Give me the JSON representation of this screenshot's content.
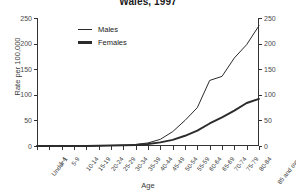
{
  "chart_data": {
    "type": "line",
    "title": "Wales, 1997",
    "xlabel": "Age",
    "ylabel": "Rate per 100,000",
    "ylim": [
      0,
      250
    ],
    "yticks": [
      0,
      50,
      100,
      150,
      200,
      250
    ],
    "grid": false,
    "legend_position": "top-left-inside",
    "dual_y_axis": true,
    "categories": [
      "Under 1",
      "1-4",
      "5-9",
      "10-14",
      "15-19",
      "20-24",
      "25-29",
      "30-34",
      "35-39",
      "40-44",
      "45-49",
      "50-54",
      "55-59",
      "60-64",
      "65-69",
      "70-74",
      "75-79",
      "80-84",
      "85 and over"
    ],
    "series": [
      {
        "name": "Males",
        "values": [
          0,
          0,
          0,
          0,
          0,
          0.5,
          1,
          1.5,
          3,
          6,
          13,
          28,
          50,
          75,
          128,
          136,
          172,
          198,
          235
        ]
      },
      {
        "name": "Females",
        "values": [
          0,
          0,
          0,
          0,
          0,
          0.5,
          1,
          1.5,
          2,
          4,
          7,
          12,
          20,
          30,
          44,
          56,
          69,
          84,
          92
        ]
      }
    ]
  },
  "legend": {
    "males_label": "Males",
    "females_label": "Females"
  },
  "axis": {
    "y_left_labels": [
      "0",
      "50",
      "100",
      "150",
      "200",
      "250"
    ],
    "y_right_labels": [
      "0",
      "50",
      "100",
      "150",
      "200",
      "250"
    ]
  }
}
